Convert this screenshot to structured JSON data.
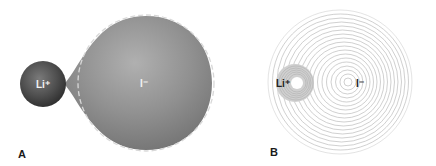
{
  "figure": {
    "panels": [
      {
        "id": "A",
        "label": "A",
        "cation_label": "Li⁺",
        "anion_label": "I⁻",
        "description": "Polarized iodide anion distorted toward lithium cation; dashed outline shows unpolarized spherical shape"
      },
      {
        "id": "B",
        "label": "B",
        "cation_label": "Li⁺",
        "anion_label": "I⁻",
        "description": "Electron density contour lines of iodide distorted toward lithium cation"
      }
    ],
    "colors": {
      "cation_fill": "#4a4a4a",
      "anion_fill": "#8e8e8e",
      "dashed_outline": "#cfcfcf",
      "contour_line": "#b8b8b8",
      "cation_ring": "#c8c8c8",
      "text_light": "#f2f2f2",
      "text_dark": "#222222"
    }
  }
}
